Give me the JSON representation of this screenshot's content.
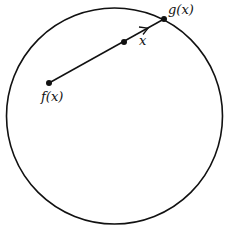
{
  "diagram": {
    "type": "retraction-disk",
    "circle": {
      "cx": 114.5,
      "cy": 116,
      "r": 108,
      "stroke": "#111111"
    },
    "points": {
      "f": {
        "x": 49,
        "y": 83,
        "label": "f(x)"
      },
      "x": {
        "x": 124,
        "y": 42,
        "label": "x"
      },
      "g": {
        "x": 164,
        "y": 19,
        "label": "g(x)"
      }
    },
    "labels": {
      "f": "f(x)",
      "x": "x",
      "g": "g(x)"
    }
  }
}
